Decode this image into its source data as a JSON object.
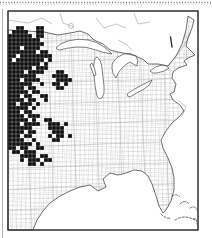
{
  "figure": {
    "canvas": {
      "width": 212,
      "height": 238
    },
    "frame": {
      "x": 8,
      "y": 11,
      "width": 190,
      "height": 219
    },
    "grid_origin": {
      "x": 8,
      "y": 26
    },
    "cell_size": 4,
    "colors": {
      "background": "#ffffff",
      "county_line": "#b5b5b5",
      "county_line_2": "#cccccc",
      "state_line": "#909090",
      "coastline": "#4a4a4a",
      "filled_county": "#0e0e0e",
      "frame_border": "#2e2e2e",
      "canada_line": "#9a9a9a",
      "dotted_rule": "#777777",
      "side_rule": "#aaaaaa"
    },
    "features": [
      "great-lakes",
      "atlantic-coast",
      "gulf-coast",
      "florida-peninsula",
      "bahamas-dashed-islets",
      "county-mesh",
      "filled-county-cluster-great-plains"
    ]
  },
  "filled_counties": {
    "description": "Black-filled county cells (presence records), grid coords [col,row] from grid_origin at cell_size px",
    "cells": [
      [
        2,
        0
      ],
      [
        3,
        0
      ],
      [
        7,
        0
      ],
      [
        8,
        0
      ],
      [
        1,
        1
      ],
      [
        2,
        1
      ],
      [
        3,
        1
      ],
      [
        4,
        1
      ],
      [
        7,
        1
      ],
      [
        8,
        1
      ],
      [
        0,
        2
      ],
      [
        1,
        2
      ],
      [
        2,
        2
      ],
      [
        3,
        2
      ],
      [
        4,
        2
      ],
      [
        5,
        2
      ],
      [
        7,
        2
      ],
      [
        8,
        2
      ],
      [
        0,
        3
      ],
      [
        1,
        3
      ],
      [
        2,
        3
      ],
      [
        3,
        3
      ],
      [
        4,
        3
      ],
      [
        5,
        3
      ],
      [
        6,
        3
      ],
      [
        7,
        3
      ],
      [
        0,
        4
      ],
      [
        1,
        4
      ],
      [
        2,
        4
      ],
      [
        3,
        4
      ],
      [
        4,
        4
      ],
      [
        5,
        4
      ],
      [
        6,
        4
      ],
      [
        7,
        4
      ],
      [
        8,
        4
      ],
      [
        0,
        5
      ],
      [
        1,
        5
      ],
      [
        2,
        5
      ],
      [
        4,
        5
      ],
      [
        5,
        5
      ],
      [
        6,
        5
      ],
      [
        7,
        5
      ],
      [
        0,
        6
      ],
      [
        1,
        6
      ],
      [
        2,
        6
      ],
      [
        3,
        6
      ],
      [
        4,
        6
      ],
      [
        5,
        6
      ],
      [
        6,
        6
      ],
      [
        8,
        6
      ],
      [
        9,
        6
      ],
      [
        0,
        7
      ],
      [
        1,
        7
      ],
      [
        3,
        7
      ],
      [
        4,
        7
      ],
      [
        5,
        7
      ],
      [
        6,
        7
      ],
      [
        7,
        7
      ],
      [
        8,
        7
      ],
      [
        9,
        7
      ],
      [
        10,
        7
      ],
      [
        0,
        8
      ],
      [
        2,
        8
      ],
      [
        3,
        8
      ],
      [
        4,
        8
      ],
      [
        5,
        8
      ],
      [
        6,
        8
      ],
      [
        7,
        8
      ],
      [
        8,
        8
      ],
      [
        10,
        8
      ],
      [
        0,
        9
      ],
      [
        1,
        9
      ],
      [
        2,
        9
      ],
      [
        3,
        9
      ],
      [
        4,
        9
      ],
      [
        5,
        9
      ],
      [
        6,
        9
      ],
      [
        7,
        9
      ],
      [
        9,
        9
      ],
      [
        0,
        10
      ],
      [
        1,
        10
      ],
      [
        2,
        10
      ],
      [
        3,
        10
      ],
      [
        4,
        10
      ],
      [
        5,
        10
      ],
      [
        7,
        10
      ],
      [
        8,
        10
      ],
      [
        9,
        10
      ],
      [
        0,
        11
      ],
      [
        1,
        11
      ],
      [
        2,
        11
      ],
      [
        3,
        11
      ],
      [
        5,
        11
      ],
      [
        6,
        11
      ],
      [
        7,
        11
      ],
      [
        8,
        11
      ],
      [
        12,
        11
      ],
      [
        13,
        11
      ],
      [
        0,
        12
      ],
      [
        1,
        12
      ],
      [
        2,
        12
      ],
      [
        3,
        12
      ],
      [
        4,
        12
      ],
      [
        5,
        12
      ],
      [
        6,
        12
      ],
      [
        11,
        12
      ],
      [
        12,
        12
      ],
      [
        13,
        12
      ],
      [
        14,
        12
      ],
      [
        0,
        13
      ],
      [
        1,
        13
      ],
      [
        2,
        13
      ],
      [
        4,
        13
      ],
      [
        5,
        13
      ],
      [
        6,
        13
      ],
      [
        7,
        13
      ],
      [
        12,
        13
      ],
      [
        13,
        13
      ],
      [
        14,
        13
      ],
      [
        15,
        13
      ],
      [
        0,
        14
      ],
      [
        1,
        14
      ],
      [
        2,
        14
      ],
      [
        3,
        14
      ],
      [
        4,
        14
      ],
      [
        5,
        14
      ],
      [
        8,
        14
      ],
      [
        11,
        14
      ],
      [
        12,
        14
      ],
      [
        14,
        14
      ],
      [
        0,
        15
      ],
      [
        1,
        15
      ],
      [
        2,
        15
      ],
      [
        3,
        15
      ],
      [
        5,
        15
      ],
      [
        6,
        15
      ],
      [
        12,
        15
      ],
      [
        13,
        15
      ],
      [
        0,
        16
      ],
      [
        1,
        16
      ],
      [
        2,
        16
      ],
      [
        3,
        16
      ],
      [
        4,
        16
      ],
      [
        6,
        16
      ],
      [
        7,
        16
      ],
      [
        0,
        17
      ],
      [
        1,
        17
      ],
      [
        2,
        17
      ],
      [
        4,
        17
      ],
      [
        5,
        17
      ],
      [
        8,
        17
      ],
      [
        9,
        17
      ],
      [
        0,
        18
      ],
      [
        1,
        18
      ],
      [
        2,
        18
      ],
      [
        3,
        18
      ],
      [
        5,
        18
      ],
      [
        6,
        18
      ],
      [
        9,
        18
      ],
      [
        0,
        19
      ],
      [
        1,
        19
      ],
      [
        3,
        19
      ],
      [
        4,
        19
      ],
      [
        5,
        19
      ],
      [
        7,
        19
      ],
      [
        0,
        20
      ],
      [
        1,
        20
      ],
      [
        2,
        20
      ],
      [
        3,
        20
      ],
      [
        4,
        20
      ],
      [
        6,
        20
      ],
      [
        0,
        21
      ],
      [
        1,
        21
      ],
      [
        2,
        21
      ],
      [
        4,
        21
      ],
      [
        5,
        21
      ],
      [
        0,
        22
      ],
      [
        1,
        22
      ],
      [
        2,
        22
      ],
      [
        3,
        22
      ],
      [
        5,
        22
      ],
      [
        6,
        22
      ],
      [
        7,
        22
      ],
      [
        0,
        23
      ],
      [
        1,
        23
      ],
      [
        2,
        23
      ],
      [
        3,
        23
      ],
      [
        4,
        23
      ],
      [
        6,
        23
      ],
      [
        9,
        23
      ],
      [
        10,
        23
      ],
      [
        0,
        24
      ],
      [
        1,
        24
      ],
      [
        2,
        24
      ],
      [
        4,
        24
      ],
      [
        5,
        24
      ],
      [
        6,
        24
      ],
      [
        7,
        24
      ],
      [
        10,
        24
      ],
      [
        11,
        24
      ],
      [
        12,
        24
      ],
      [
        14,
        24
      ],
      [
        0,
        25
      ],
      [
        1,
        25
      ],
      [
        2,
        25
      ],
      [
        3,
        25
      ],
      [
        4,
        25
      ],
      [
        5,
        25
      ],
      [
        10,
        25
      ],
      [
        11,
        25
      ],
      [
        12,
        25
      ],
      [
        13,
        25
      ],
      [
        0,
        26
      ],
      [
        1,
        26
      ],
      [
        2,
        26
      ],
      [
        3,
        26
      ],
      [
        5,
        26
      ],
      [
        6,
        26
      ],
      [
        11,
        26
      ],
      [
        12,
        26
      ],
      [
        13,
        26
      ],
      [
        0,
        27
      ],
      [
        1,
        27
      ],
      [
        2,
        27
      ],
      [
        4,
        27
      ],
      [
        5,
        27
      ],
      [
        10,
        27
      ],
      [
        12,
        27
      ],
      [
        13,
        27
      ],
      [
        15,
        27
      ],
      [
        0,
        28
      ],
      [
        1,
        28
      ],
      [
        2,
        28
      ],
      [
        3,
        28
      ],
      [
        6,
        28
      ],
      [
        11,
        28
      ],
      [
        12,
        28
      ],
      [
        0,
        29
      ],
      [
        1,
        29
      ],
      [
        2,
        29
      ],
      [
        3,
        29
      ],
      [
        4,
        29
      ],
      [
        5,
        29
      ],
      [
        7,
        29
      ],
      [
        0,
        30
      ],
      [
        1,
        30
      ],
      [
        3,
        30
      ],
      [
        4,
        30
      ],
      [
        7,
        30
      ],
      [
        8,
        30
      ],
      [
        1,
        31
      ],
      [
        2,
        31
      ],
      [
        4,
        31
      ],
      [
        5,
        31
      ],
      [
        6,
        31
      ],
      [
        3,
        32
      ],
      [
        4,
        32
      ],
      [
        5,
        32
      ],
      [
        6,
        32
      ],
      [
        8,
        32
      ],
      [
        9,
        32
      ],
      [
        3,
        33
      ],
      [
        5,
        33
      ],
      [
        6,
        33
      ],
      [
        7,
        33
      ],
      [
        9,
        33
      ],
      [
        10,
        33
      ],
      [
        5,
        34
      ],
      [
        6,
        34
      ],
      [
        8,
        34
      ]
    ]
  }
}
